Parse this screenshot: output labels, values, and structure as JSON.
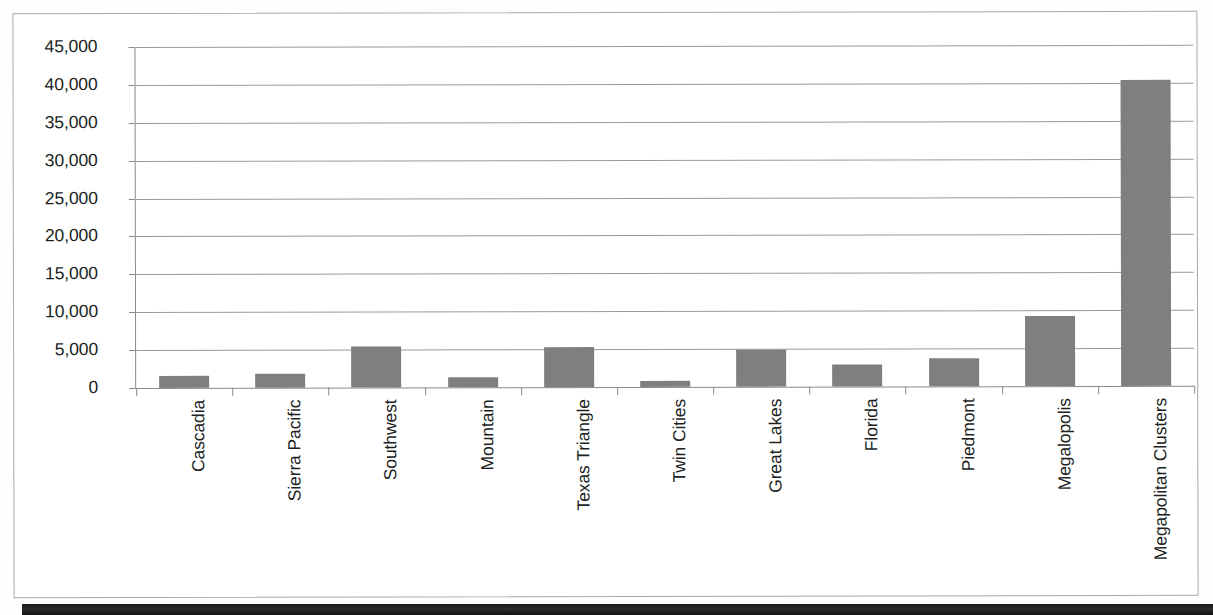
{
  "chart_data": {
    "type": "bar",
    "title": "",
    "subtitle": "",
    "xlabel": "",
    "ylabel": "",
    "ylim": [
      0,
      45000
    ],
    "grid": true,
    "legend": false,
    "legend_position": "none",
    "orientation": "vertical",
    "bar_color": "#7f7f7f",
    "categories": [
      "Cascadia",
      "Sierra Pacific",
      "Southwest",
      "Mountain",
      "Texas Triangle",
      "Twin Cities",
      "Great Lakes",
      "Florida",
      "Piedmont",
      "Megalopolis",
      "Megapolitan Clusters"
    ],
    "values": [
      1650,
      1800,
      5400,
      1300,
      5250,
      800,
      4900,
      2900,
      3700,
      9200,
      40400
    ],
    "ytick_labels": [
      "45,000",
      "40,000",
      "35,000",
      "30,000",
      "25,000",
      "20,000",
      "15,000",
      "10,000",
      "5,000",
      "0"
    ],
    "ytick_values": [
      45000,
      40000,
      35000,
      30000,
      25000,
      20000,
      15000,
      10000,
      5000,
      0
    ]
  },
  "colors": {
    "bar": "#7f7f7f",
    "gridline": "#9b9b9b",
    "axis": "#8a8a8a",
    "text": "#201f1e",
    "frame_border": "#a8a8a8",
    "page_edge": "#1a1a1a",
    "background": "#ffffff"
  }
}
